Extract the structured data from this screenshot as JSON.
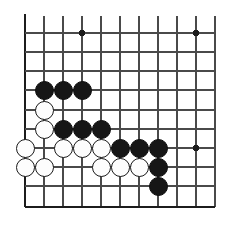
{
  "board": {
    "title": "Go board position diagram",
    "game": "Go (Weiqi/Baduk)",
    "view": "bottom-left corner, partial board",
    "grid": {
      "line_color": "#4a4a4a",
      "border_color": "#1c1c1c",
      "background_color": "#ffffff",
      "cell_size_px": 19,
      "vertical_line_x": [
        25,
        44,
        63,
        82,
        101,
        120,
        139,
        158,
        177,
        196,
        215
      ],
      "horizontal_line_y": [
        33,
        52,
        71,
        90,
        110,
        129,
        148,
        167,
        186,
        207
      ],
      "edge_lines": {
        "left_x": 25,
        "bottom_y": 207
      },
      "cut_off_edges": [
        "top",
        "right"
      ]
    },
    "star_points": [
      {
        "x": 82,
        "y": 33,
        "name": "star-point-upper-left"
      },
      {
        "x": 196,
        "y": 33,
        "name": "star-point-upper-right"
      },
      {
        "x": 196,
        "y": 148,
        "name": "star-point-lower-right"
      }
    ],
    "star_point_radius_px": 3,
    "stone_colors": {
      "black": "#161616",
      "white": "#fdfdfd",
      "white_outline": "#1a1a1a"
    },
    "counts": {
      "black_stones": 11,
      "white_stones": 11,
      "total_stones": 22
    },
    "stones": [
      {
        "color": "black",
        "x": 44,
        "y": 90,
        "label": "black-stone-1"
      },
      {
        "color": "black",
        "x": 63,
        "y": 90,
        "label": "black-stone-2"
      },
      {
        "color": "black",
        "x": 82,
        "y": 90,
        "label": "black-stone-3"
      },
      {
        "color": "white",
        "x": 44,
        "y": 110,
        "label": "white-stone-1"
      },
      {
        "color": "white",
        "x": 44,
        "y": 129,
        "label": "white-stone-2"
      },
      {
        "color": "black",
        "x": 63,
        "y": 129,
        "label": "black-stone-4"
      },
      {
        "color": "black",
        "x": 82,
        "y": 129,
        "label": "black-stone-5"
      },
      {
        "color": "black",
        "x": 101,
        "y": 129,
        "label": "black-stone-6"
      },
      {
        "color": "white",
        "x": 25,
        "y": 148,
        "label": "white-stone-3"
      },
      {
        "color": "white",
        "x": 63,
        "y": 148,
        "label": "white-stone-4"
      },
      {
        "color": "white",
        "x": 82,
        "y": 148,
        "label": "white-stone-5"
      },
      {
        "color": "white",
        "x": 101,
        "y": 148,
        "label": "white-stone-6"
      },
      {
        "color": "black",
        "x": 120,
        "y": 148,
        "label": "black-stone-7"
      },
      {
        "color": "black",
        "x": 139,
        "y": 148,
        "label": "black-stone-8"
      },
      {
        "color": "black",
        "x": 158,
        "y": 148,
        "label": "black-stone-9"
      },
      {
        "color": "white",
        "x": 25,
        "y": 167,
        "label": "white-stone-7"
      },
      {
        "color": "white",
        "x": 44,
        "y": 167,
        "label": "white-stone-8"
      },
      {
        "color": "white",
        "x": 101,
        "y": 167,
        "label": "white-stone-9"
      },
      {
        "color": "white",
        "x": 120,
        "y": 167,
        "label": "white-stone-10"
      },
      {
        "color": "white",
        "x": 139,
        "y": 167,
        "label": "white-stone-11"
      },
      {
        "color": "black",
        "x": 158,
        "y": 167,
        "label": "black-stone-10"
      },
      {
        "color": "black",
        "x": 158,
        "y": 186,
        "label": "black-stone-11"
      }
    ]
  }
}
